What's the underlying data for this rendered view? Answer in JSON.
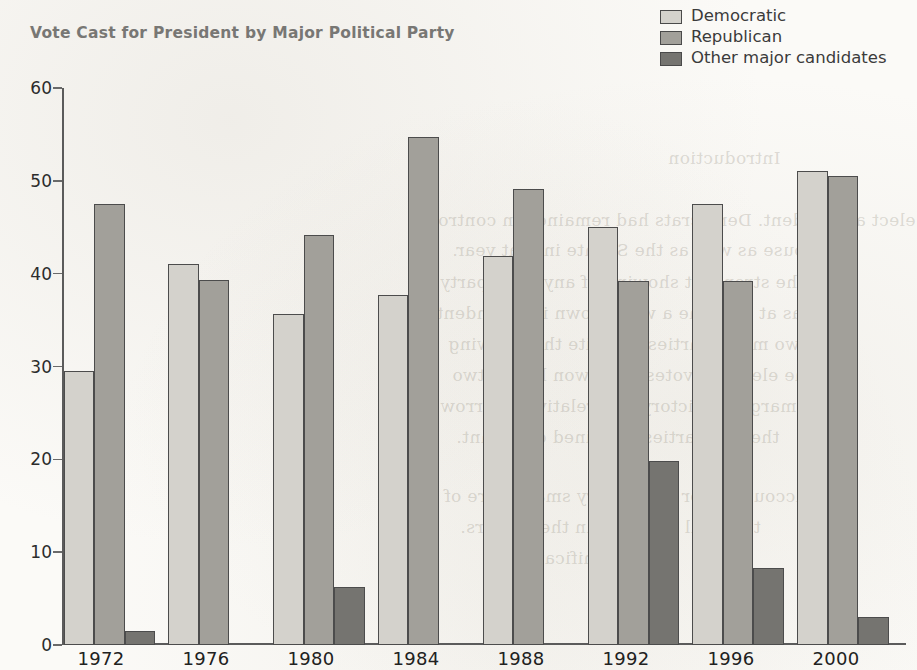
{
  "chart_data": {
    "type": "bar",
    "title": "Vote Cast for President by Major Political Party",
    "xlabel": "",
    "ylabel": "",
    "ylim": [
      0,
      60
    ],
    "yticks": [
      0,
      10,
      20,
      30,
      40,
      50,
      60
    ],
    "grid": false,
    "legend_position": "top-right",
    "categories": [
      "1972",
      "1976",
      "1980",
      "1984",
      "1988",
      "1992",
      "1996",
      "2000"
    ],
    "series": [
      {
        "name": "Democratic",
        "color": "#d4d2cc",
        "values": [
          29.5,
          41.0,
          35.7,
          37.7,
          41.9,
          45.0,
          47.5,
          51.1
        ]
      },
      {
        "name": "Republican",
        "color": "#a2a09a",
        "values": [
          47.5,
          39.3,
          44.2,
          54.7,
          49.1,
          39.2,
          39.2,
          50.5
        ]
      },
      {
        "name": "Other major candidates",
        "color": "#757470",
        "values": [
          1.5,
          0,
          6.2,
          0,
          0,
          19.8,
          8.3,
          3.0
        ]
      }
    ]
  },
  "legend": {
    "items": [
      {
        "label": "Democratic",
        "color": "#d4d2cc"
      },
      {
        "label": "Republican",
        "color": "#a2a09a"
      },
      {
        "label": "Other major candidates",
        "color": "#757470"
      }
    ]
  },
  "bleed_text": [
    {
      "text": "Introduction",
      "left": 668,
      "top": 148
    },
    {
      "text": "elect a President. Democrats had remained in control",
      "left": 432,
      "top": 210
    },
    {
      "text": "house as well as the Senate in that year.",
      "left": 452,
      "top": 240
    },
    {
      "text": "was the strongest showing of any third party",
      "left": 440,
      "top": 272
    },
    {
      "text": "he was at the time a well known independent",
      "left": 436,
      "top": 303
    },
    {
      "text": "the two major parties. Despite this showing",
      "left": 448,
      "top": 334
    },
    {
      "text": "the electoral votes were won by the two",
      "left": 452,
      "top": 365
    },
    {
      "text": "the margin of victory was relatively narrow",
      "left": 440,
      "top": 396
    },
    {
      "text": "the two parties remained dominant.",
      "left": 456,
      "top": 427
    },
    {
      "text": "accounted for only a very small share of",
      "left": 444,
      "top": 486
    },
    {
      "text": "the total vote cast in these years.",
      "left": 460,
      "top": 517
    },
    {
      "text": "very significant.",
      "left": 520,
      "top": 548
    }
  ]
}
